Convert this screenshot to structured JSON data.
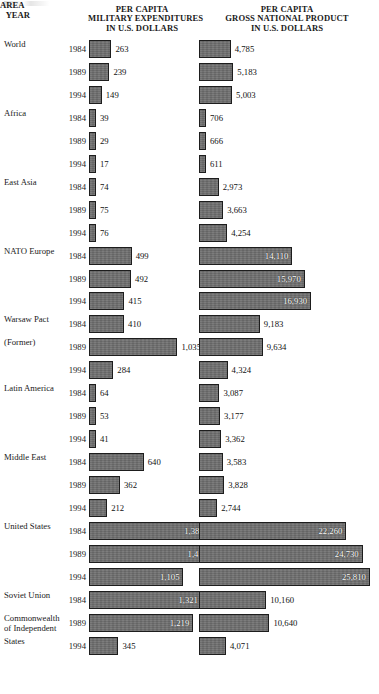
{
  "header": {
    "area_label": "AREA",
    "year_label": "YEAR",
    "military_head": [
      "PER CAPITA",
      "MILITARY EXPENDITURES",
      "IN U.S. DOLLARS"
    ],
    "gnp_head": [
      "PER CAPITA",
      "GROSS NATIONAL PRODUCT",
      "IN U.S. DOLLARS"
    ]
  },
  "colors": {
    "bar_fill": "#6e6e6e",
    "bar_border": "#1d1d1d",
    "text": "#1a1a1a",
    "inside_label": "#ffffff",
    "background": "#ffffff"
  },
  "chart_data": {
    "type": "bar",
    "title": "",
    "orientation": "horizontal",
    "grid": false,
    "legend": "none",
    "series": [
      {
        "name": "PER CAPITA MILITARY EXPENDITURES IN U.S. DOLLARS",
        "unit": "U.S. dollars"
      },
      {
        "name": "PER CAPITA GROSS NATIONAL PRODUCT IN U.S. DOLLARS",
        "unit": "U.S. dollars"
      }
    ],
    "rows": [
      {
        "area": [
          "World"
        ],
        "year": "1984",
        "military": 263,
        "military_label": "263",
        "gnp": 4785,
        "gnp_label": "4,785"
      },
      {
        "area": [],
        "year": "1989",
        "military": 239,
        "military_label": "239",
        "gnp": 5183,
        "gnp_label": "5,183"
      },
      {
        "area": [],
        "year": "1994",
        "military": 149,
        "military_label": "149",
        "gnp": 5003,
        "gnp_label": "5,003"
      },
      {
        "area": [
          "Africa"
        ],
        "year": "1984",
        "military": 39,
        "military_label": "39",
        "gnp": 706,
        "gnp_label": "706"
      },
      {
        "area": [],
        "year": "1989",
        "military": 29,
        "military_label": "29",
        "gnp": 666,
        "gnp_label": "666"
      },
      {
        "area": [],
        "year": "1994",
        "military": 17,
        "military_label": "17",
        "gnp": 611,
        "gnp_label": "611"
      },
      {
        "area": [
          "East Asia"
        ],
        "year": "1984",
        "military": 74,
        "military_label": "74",
        "gnp": 2973,
        "gnp_label": "2,973"
      },
      {
        "area": [],
        "year": "1989",
        "military": 75,
        "military_label": "75",
        "gnp": 3663,
        "gnp_label": "3,663"
      },
      {
        "area": [],
        "year": "1994",
        "military": 76,
        "military_label": "76",
        "gnp": 4254,
        "gnp_label": "4,254"
      },
      {
        "area": [
          "NATO Europe"
        ],
        "year": "1984",
        "military": 499,
        "military_label": "499",
        "gnp": 14110,
        "gnp_label": "14,110"
      },
      {
        "area": [],
        "year": "1989",
        "military": 492,
        "military_label": "492",
        "gnp": 15970,
        "gnp_label": "15,970"
      },
      {
        "area": [],
        "year": "1994",
        "military": 415,
        "military_label": "415",
        "gnp": 16930,
        "gnp_label": "16,930"
      },
      {
        "area": [
          "Warsaw Pact"
        ],
        "year": "1984",
        "military": 410,
        "military_label": "410",
        "gnp": 9183,
        "gnp_label": "9,183"
      },
      {
        "area": [
          "(Former)"
        ],
        "year": "1989",
        "military": 1035,
        "military_label": "1,035",
        "gnp": 9634,
        "gnp_label": "9,634"
      },
      {
        "area": [],
        "year": "1994",
        "military": 284,
        "military_label": "284",
        "gnp": 4324,
        "gnp_label": "4,324"
      },
      {
        "area": [
          "Latin America"
        ],
        "year": "1984",
        "military": 64,
        "military_label": "64",
        "gnp": 3087,
        "gnp_label": "3,087"
      },
      {
        "area": [],
        "year": "1989",
        "military": 53,
        "military_label": "53",
        "gnp": 3177,
        "gnp_label": "3,177"
      },
      {
        "area": [],
        "year": "1994",
        "military": 41,
        "military_label": "41",
        "gnp": 3362,
        "gnp_label": "3,362"
      },
      {
        "area": [
          "Middle East"
        ],
        "year": "1984",
        "military": 640,
        "military_label": "640",
        "gnp": 3583,
        "gnp_label": "3,583"
      },
      {
        "area": [],
        "year": "1989",
        "military": 362,
        "military_label": "362",
        "gnp": 3828,
        "gnp_label": "3,828"
      },
      {
        "area": [],
        "year": "1994",
        "military": 212,
        "military_label": "212",
        "gnp": 2744,
        "gnp_label": "2,744"
      },
      {
        "area": [
          "United States"
        ],
        "year": "1984",
        "military": 1388,
        "military_label": "1,388",
        "gnp": 22260,
        "gnp_label": "22,260"
      },
      {
        "area": [],
        "year": "1989",
        "military": 1428,
        "military_label": "1,428",
        "gnp": 24730,
        "gnp_label": "24,730"
      },
      {
        "area": [],
        "year": "1994",
        "military": 1105,
        "military_label": "1,105",
        "gnp": 25810,
        "gnp_label": "25,810"
      },
      {
        "area": [
          "Soviet Union"
        ],
        "year": "1984",
        "military": 1321,
        "military_label": "1,321",
        "gnp": 10160,
        "gnp_label": "10,160"
      },
      {
        "area": [
          "Commonwealth",
          "of Independent"
        ],
        "year": "1989",
        "military": 1219,
        "military_label": "1,219",
        "gnp": 10640,
        "gnp_label": "10,640"
      },
      {
        "area": [
          "States"
        ],
        "year": "1994",
        "military": 345,
        "military_label": "345",
        "gnp": 4071,
        "gnp_label": "4,071"
      }
    ]
  }
}
